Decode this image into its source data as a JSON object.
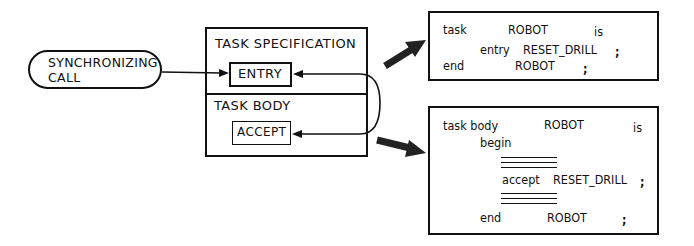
{
  "diagram": {
    "caller": {
      "label_line1": "SYNCHRONIZING",
      "label_line2": "CALL"
    },
    "task": {
      "specification_label": "TASK SPECIFICATION",
      "entry_label": "ENTRY",
      "body_label": "TASK BODY",
      "accept_label": "ACCEPT"
    },
    "spec_code": {
      "line1": {
        "kw": "task",
        "name": "ROBOT",
        "is": "is"
      },
      "line2": {
        "kw": "entry",
        "name": "RESET_DRILL",
        "semi": ";"
      },
      "line3": {
        "kw": "end",
        "name": "ROBOT",
        "semi": ";"
      }
    },
    "body_code": {
      "line1": {
        "kw": "task body",
        "name": "ROBOT",
        "is": "is"
      },
      "line2": {
        "kw": "begin"
      },
      "line3": {
        "kw": "accept",
        "name": "RESET_DRILL",
        "semi": ";"
      },
      "line4": {
        "kw": "end",
        "name": "ROBOT",
        "semi": ";"
      }
    },
    "edges": [
      {
        "from": "caller",
        "to": "entry",
        "type": "arrow"
      },
      {
        "from": "accept",
        "to": "entry",
        "type": "curved-arrow-both"
      },
      {
        "from": "task-specification",
        "to": "spec_code",
        "type": "thick-arrow"
      },
      {
        "from": "task-body",
        "to": "body_code",
        "type": "thick-arrow"
      }
    ]
  }
}
